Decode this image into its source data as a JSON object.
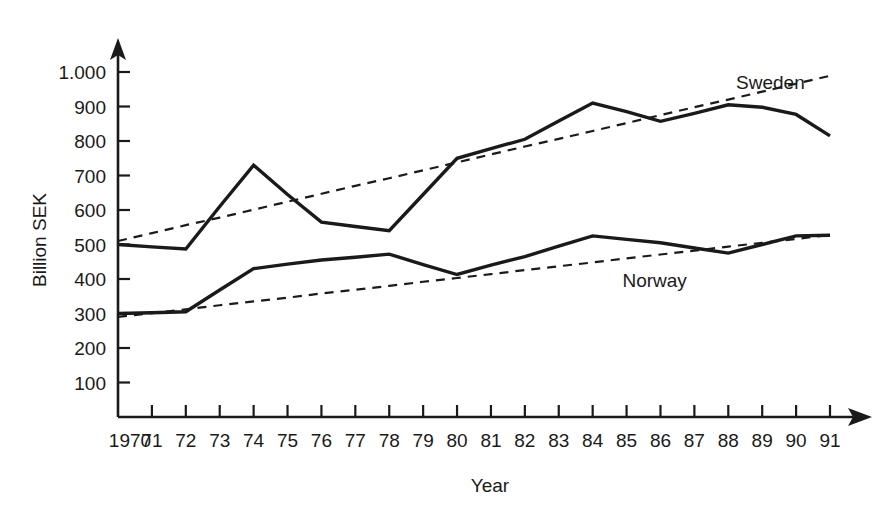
{
  "chart_data": {
    "type": "line",
    "title": "",
    "xlabel": "Year",
    "ylabel": "Billion SEK",
    "grid": false,
    "legend_position": "inline-right",
    "xlim": [
      1970,
      1991
    ],
    "ylim": [
      0,
      1000
    ],
    "y_ticks": [
      100,
      200,
      300,
      400,
      500,
      600,
      700,
      800,
      900,
      1000
    ],
    "y_tick_labels": [
      "100",
      "200",
      "300",
      "400",
      "500",
      "600",
      "700",
      "800",
      "900",
      "1.000"
    ],
    "x": [
      1970,
      1971,
      1972,
      1973,
      1974,
      1975,
      1976,
      1977,
      1978,
      1979,
      1980,
      1981,
      1982,
      1983,
      1984,
      1985,
      1986,
      1987,
      1988,
      1989,
      1990,
      1991
    ],
    "x_tick_labels": [
      "1970",
      "71",
      "72",
      "73",
      "74",
      "75",
      "76",
      "77",
      "78",
      "79",
      "80",
      "81",
      "82",
      "83",
      "84",
      "85",
      "86",
      "87",
      "88",
      "89",
      "90",
      "91"
    ],
    "series": [
      {
        "name": "Sweden",
        "style": "solid",
        "label_x": 1990,
        "label_y": 975,
        "values": [
          500,
          493,
          487,
          610,
          730,
          645,
          565,
          552,
          540,
          645,
          750,
          778,
          805,
          858,
          910,
          885,
          857,
          880,
          905,
          898,
          877,
          815
        ]
      },
      {
        "name": "Norway",
        "style": "solid",
        "label_x": 1986,
        "label_y": 400,
        "values": [
          300,
          302,
          305,
          368,
          430,
          443,
          455,
          463,
          472,
          442,
          413,
          440,
          465,
          495,
          525,
          515,
          505,
          490,
          475,
          500,
          525,
          527
        ]
      },
      {
        "name": "Sweden trend",
        "style": "dashed",
        "values": [
          510,
          533,
          556,
          578,
          601,
          624,
          647,
          670,
          692,
          715,
          738,
          761,
          784,
          806,
          829,
          852,
          875,
          898,
          920,
          943,
          966,
          989
        ]
      },
      {
        "name": "Norway trend",
        "style": "dashed",
        "values": [
          290,
          301,
          312,
          324,
          335,
          346,
          358,
          369,
          380,
          392,
          403,
          414,
          426,
          437,
          448,
          460,
          471,
          482,
          494,
          505,
          516,
          528
        ]
      }
    ]
  },
  "axis": {
    "y_title": "Billion SEK",
    "x_title": "Year"
  },
  "labels": {
    "sweden": "Sweden",
    "norway": "Norway"
  }
}
